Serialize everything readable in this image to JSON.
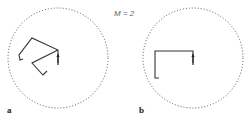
{
  "figure": {
    "annotation": "M = 2",
    "panels": [
      {
        "label": "a",
        "circle": {
          "cx": 58,
          "cy": 58,
          "r": 50
        },
        "paths": [
          "M58,63 L58,50 L32,38 L19,55 L20,60 L23,59",
          "M58,50 L32,63 L43,75 L47,71"
        ],
        "arrow": {
          "x": 58,
          "y1": 64,
          "y2": 55
        }
      },
      {
        "label": "b",
        "circle": {
          "cx": 193,
          "cy": 58,
          "r": 50
        },
        "paths": [
          "M193,63 L193,51 L155,51 L155,78 L159,78"
        ],
        "arrow": {
          "x": 193,
          "y1": 64,
          "y2": 55
        }
      }
    ],
    "colors": {
      "line": "#333333",
      "circle": "#555555",
      "text": "#222222"
    }
  }
}
